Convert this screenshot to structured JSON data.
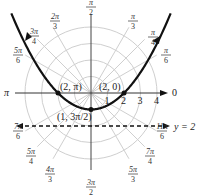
{
  "chart_data": {
    "type": "polar",
    "title": "",
    "equation_curve": "r = 2 / (1 - sin θ)",
    "center_px": [
      91,
      93
    ],
    "px_per_unit": 16.5,
    "radial_ticks": [
      "1",
      "2",
      "3",
      "4"
    ],
    "radial_range": [
      0,
      4
    ],
    "angle_labels": [
      {
        "label": "0",
        "theta": 0
      },
      {
        "label": "π/6",
        "theta": 30
      },
      {
        "label": "π/4",
        "theta": 45
      },
      {
        "label": "π/3",
        "theta": 60
      },
      {
        "label": "π/2",
        "theta": 90
      },
      {
        "label": "2π/3",
        "theta": 120
      },
      {
        "label": "3π/4",
        "theta": 135
      },
      {
        "label": "5π/6",
        "theta": 150
      },
      {
        "label": "π",
        "theta": 180
      },
      {
        "label": "7π/6",
        "theta": 210
      },
      {
        "label": "5π/4",
        "theta": 225
      },
      {
        "label": "4π/3",
        "theta": 240
      },
      {
        "label": "3π/2",
        "theta": 270
      },
      {
        "label": "5π/3",
        "theta": 300
      },
      {
        "label": "7π/4",
        "theta": 315
      },
      {
        "label": "11π/6",
        "theta": 330
      }
    ],
    "points": [
      {
        "label": "(2, π)",
        "r": 2,
        "theta": 180
      },
      {
        "label": "(2, 0)",
        "r": 2,
        "theta": 0
      },
      {
        "label": "(1, 3π/2)",
        "r": 1,
        "theta": 270
      }
    ],
    "directrix": {
      "label": "y = 2",
      "style": "dashed",
      "offset_units": 2
    },
    "grid": true,
    "curve_theta_range_deg": [
      -225,
      45
    ]
  }
}
